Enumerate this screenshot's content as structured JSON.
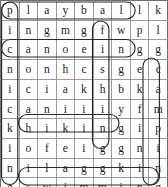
{
  "puzzle": {
    "type": "word-search",
    "rows": 10,
    "cols": 10,
    "grid": [
      [
        "p",
        "l",
        "a",
        "y",
        "b",
        "a",
        "l",
        "l",
        "k",
        ""
      ],
      [
        "i",
        "n",
        "g",
        "m",
        "g",
        "f",
        "w",
        "p",
        "l",
        ""
      ],
      [
        "c",
        "a",
        "n",
        "o",
        "e",
        "i",
        "n",
        "g",
        "g",
        ""
      ],
      [
        "n",
        "o",
        "n",
        "h",
        "c",
        "s",
        "g",
        "e",
        "c",
        ""
      ],
      [
        "i",
        "c",
        "i",
        "a",
        "k",
        "h",
        "b",
        "k",
        "a",
        ""
      ],
      [
        "c",
        "a",
        "n",
        "i",
        "i",
        "i",
        "y",
        "f",
        "m",
        ""
      ],
      [
        "k",
        "h",
        "i",
        "k",
        "i",
        "n",
        "g",
        "i",
        "p",
        ""
      ],
      [
        "i",
        "o",
        "f",
        "e",
        "i",
        "g",
        "g",
        "n",
        "i",
        ""
      ],
      [
        "n",
        "i",
        "l",
        "a",
        "g",
        "g",
        "k",
        "i",
        "n",
        ""
      ],
      [
        "g",
        "s",
        "w",
        "i",
        "m",
        "m",
        "i",
        "n",
        "g",
        ""
      ]
    ],
    "cells": [
      [
        "p",
        "l",
        "a",
        "y",
        "b",
        "a",
        "l",
        "l",
        "k"
      ],
      [
        "i",
        "n",
        "g",
        "m",
        "g",
        "f",
        "w",
        "p",
        "l"
      ],
      [
        "c",
        "a",
        "n",
        "o",
        "e",
        "i",
        "n",
        "g",
        "g"
      ],
      [
        "n",
        "o",
        "n",
        "h",
        "c",
        "s",
        "g",
        "e",
        "c"
      ],
      [
        "i",
        "c",
        "i",
        "a",
        "k",
        "h",
        "b",
        "k",
        "a"
      ],
      [
        "c",
        "a",
        "n",
        "i",
        "i",
        "i",
        "y",
        "f",
        "m"
      ],
      [
        "k",
        "h",
        "i",
        "k",
        "i",
        "n",
        "g",
        "i",
        "p"
      ],
      [
        "i",
        "o",
        "f",
        "e",
        "i",
        "g",
        "g",
        "n",
        "i"
      ],
      [
        "n",
        "i",
        "l",
        "a",
        "g",
        "g",
        "k",
        "i",
        "n"
      ],
      [
        "g",
        "s",
        "w",
        "i",
        "m",
        "m",
        "i",
        "n",
        "g"
      ]
    ],
    "found_words": [
      {
        "word": "playball",
        "direction": "horizontal",
        "row": 1,
        "start_col": 1,
        "end_col": 8
      },
      {
        "word": "canoeing",
        "direction": "horizontal",
        "row": 3,
        "start_col": 1,
        "end_col": 8
      },
      {
        "word": "hiking",
        "direction": "horizontal",
        "row": 7,
        "start_col": 2,
        "end_col": 7
      },
      {
        "word": "swimming",
        "direction": "horizontal",
        "row": 10,
        "start_col": 2,
        "end_col": 9
      },
      {
        "word": "picnicking",
        "direction": "vertical",
        "col": 1,
        "start_row": 1,
        "end_row": 10
      },
      {
        "word": "fishing",
        "direction": "vertical",
        "col": 6,
        "start_row": 2,
        "end_row": 8
      },
      {
        "word": "camping",
        "direction": "vertical",
        "col": 9,
        "start_row": 4,
        "end_row": 10
      }
    ],
    "colors": {
      "grid_line": "#9a9a9a",
      "border": "#6f6f6f",
      "letter": "#1a1a1a",
      "circle": "#2b2b2b",
      "background": "#ffffff"
    }
  }
}
